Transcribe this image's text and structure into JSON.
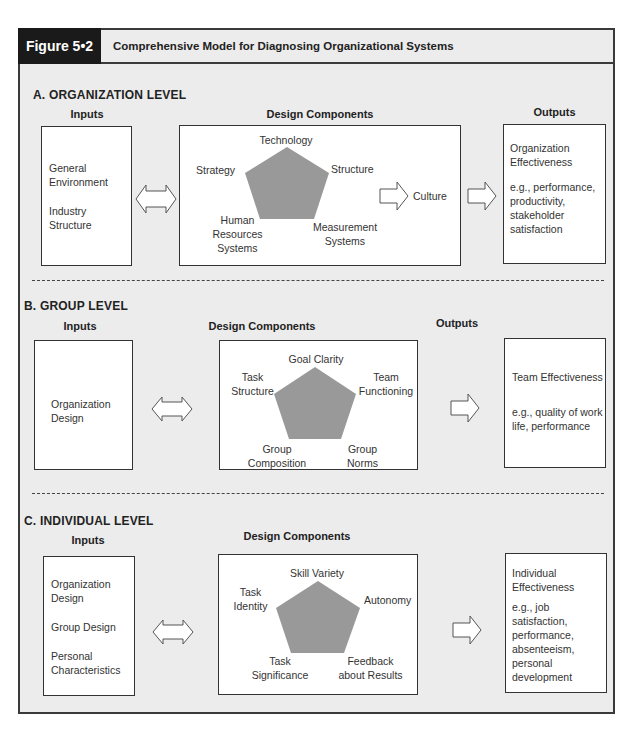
{
  "figure": {
    "label": "Figure 5•2",
    "title": "Comprehensive Model for Diagnosing Organizational Systems"
  },
  "colors": {
    "frame_bg": "#ececec",
    "tab_bg": "#1a1a1a",
    "pentagon": "#999999",
    "border": "#333333"
  },
  "sections": [
    {
      "title": "A. ORGANIZATION LEVEL",
      "inputs_label": "Inputs",
      "design_label": "Design Components",
      "outputs_label": "Outputs",
      "inputs": [
        "General Environment",
        "Industry Structure"
      ],
      "components": {
        "top": "Technology",
        "left": "Strategy",
        "right": "Structure",
        "bottom_left": "Human Resources Systems",
        "bottom_right": "Measurement Systems"
      },
      "culture": "Culture",
      "output_title": "Organization Effectiveness",
      "output_examples": "e.g., performance, productivity, stakeholder satisfaction"
    },
    {
      "title": "B. GROUP LEVEL",
      "inputs_label": "Inputs",
      "design_label": "Design Components",
      "outputs_label": "Outputs",
      "inputs": [
        "Organization Design"
      ],
      "components": {
        "top": "Goal Clarity",
        "left": "Task Structure",
        "right": "Team Functioning",
        "bottom_left": "Group Composition",
        "bottom_right": "Group Norms"
      },
      "output_title": "Team Effectiveness",
      "output_examples": "e.g., quality of work life, performance"
    },
    {
      "title": "C. INDIVIDUAL LEVEL",
      "inputs_label": "Inputs",
      "design_label": "Design Components",
      "inputs": [
        "Organization Design",
        "Group Design",
        "Personal Characteristics"
      ],
      "components": {
        "top": "Skill Variety",
        "left": "Task Identity",
        "right": "Autonomy",
        "bottom_left": "Task Significance",
        "bottom_right": "Feedback about Results"
      },
      "output_title": "Individual Effectiveness",
      "output_examples": "e.g., job satisfaction, performance, absenteeism, personal development"
    }
  ]
}
